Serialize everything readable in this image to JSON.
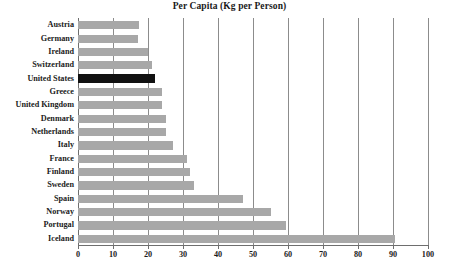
{
  "chart_data": {
    "type": "bar",
    "orientation": "horizontal",
    "title": "Per Capita (Kg per Person)",
    "xlabel": "",
    "ylabel": "",
    "xlim": [
      0,
      100
    ],
    "xticks": [
      0,
      10,
      20,
      30,
      40,
      50,
      60,
      70,
      80,
      90,
      100
    ],
    "grid": true,
    "legend": null,
    "categories": [
      "Austria",
      "Germany",
      "Ireland",
      "Switzerland",
      "United States",
      "Greece",
      "United Kingdom",
      "Denmark",
      "Netherlands",
      "Italy",
      "France",
      "Finland",
      "Sweden",
      "Spain",
      "Norway",
      "Portugal",
      "Iceland"
    ],
    "values": [
      17.5,
      17,
      20,
      21,
      22,
      24,
      24,
      25,
      25,
      27,
      31,
      32,
      33,
      47,
      55,
      59.5,
      90.5
    ],
    "bar_color": "#a8a8a8",
    "highlight_color": "#111111",
    "highlighted_category": "United States"
  }
}
